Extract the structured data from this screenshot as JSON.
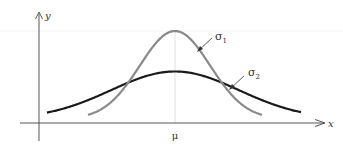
{
  "diagram": {
    "axes": {
      "x_label": "x",
      "y_label": "y",
      "center_label": "μ"
    },
    "curves": [
      {
        "name": "sigma1",
        "label": "σ",
        "subscript": "1",
        "relative_sigma": 0.55,
        "relative_peak": 1.0,
        "color": "#8a8a8a"
      },
      {
        "name": "sigma2",
        "label": "σ",
        "subscript": "2",
        "relative_sigma": 1.0,
        "relative_peak": 0.56,
        "color": "#1a1a1a"
      }
    ]
  }
}
